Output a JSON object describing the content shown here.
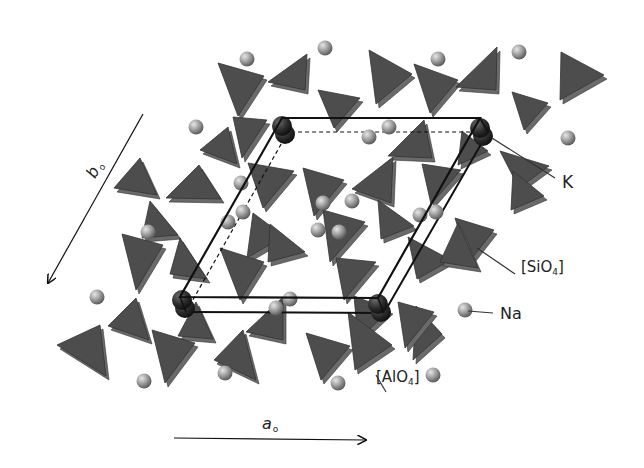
{
  "figure": {
    "title": "",
    "colors": {
      "tetrahedron": "#4d4d4d",
      "tetrahedron_edge": "#333333",
      "tetrahedron_shade": "#6a6a6a",
      "na_atom": "#9a9a9a",
      "k_atom": "#2e2e2e",
      "cell_line": "#111111",
      "leader_line": "#333333"
    },
    "axes": {
      "a": {
        "symbol": "a",
        "subscript": "o",
        "arrow": {
          "x1": 174,
          "y1": 438,
          "x2": 366,
          "y2": 440
        }
      },
      "b": {
        "symbol": "b",
        "subscript": "o",
        "arrow": {
          "x1": 143,
          "y1": 114,
          "x2": 48,
          "y2": 283
        }
      }
    },
    "labels": {
      "K": {
        "text": "K",
        "x": 562,
        "y": 172,
        "leader": {
          "x1": 492,
          "y1": 138,
          "x2": 555,
          "y2": 178
        }
      },
      "SiO4": {
        "prefix": "[SiO",
        "sub": "4",
        "suffix": "]",
        "x": 521,
        "y": 258,
        "leader": {
          "x1": 477,
          "y1": 248,
          "x2": 515,
          "y2": 274
        }
      },
      "Na": {
        "text": "Na",
        "x": 500,
        "y": 304,
        "leader": {
          "x1": 468,
          "y1": 311,
          "x2": 493,
          "y2": 313
        }
      },
      "AlO4": {
        "prefix": "[AlO",
        "sub": "4",
        "suffix": "]",
        "x": 376,
        "y": 368,
        "leader": {
          "x1": 376,
          "y1": 375,
          "x2": 386,
          "y2": 392
        }
      }
    },
    "unit_cell": {
      "front": [
        [
          282,
          118
        ],
        [
          480,
          118
        ],
        [
          378,
          298
        ],
        [
          180,
          297
        ]
      ],
      "back": [
        [
          288,
          132
        ],
        [
          488,
          132
        ],
        [
          384,
          313
        ],
        [
          186,
          312
        ]
      ]
    },
    "k_atoms": [
      [
        282,
        126
      ],
      [
        480,
        128
      ],
      [
        182,
        300
      ],
      [
        378,
        304
      ]
    ],
    "na_atoms": [
      [
        247,
        59
      ],
      [
        325,
        48
      ],
      [
        438,
        59
      ],
      [
        519,
        52
      ],
      [
        196,
        127
      ],
      [
        369,
        137
      ],
      [
        389,
        127
      ],
      [
        568,
        138
      ],
      [
        228,
        222
      ],
      [
        243,
        212
      ],
      [
        323,
        203
      ],
      [
        339,
        232
      ],
      [
        420,
        215
      ],
      [
        436,
        212
      ],
      [
        148,
        232
      ],
      [
        318,
        230
      ],
      [
        97,
        297
      ],
      [
        276,
        308
      ],
      [
        290,
        299
      ],
      [
        465,
        310
      ],
      [
        144,
        381
      ],
      [
        225,
        373
      ],
      [
        338,
        383
      ],
      [
        433,
        375
      ],
      [
        241,
        183
      ],
      [
        352,
        201
      ]
    ],
    "tetrahedra": [
      [
        [
          218,
          63
        ],
        [
          264,
          76
        ],
        [
          238,
          116
        ]
      ],
      [
        [
          307,
          54
        ],
        [
          305,
          90
        ],
        [
          268,
          82
        ]
      ],
      [
        [
          369,
          50
        ],
        [
          412,
          74
        ],
        [
          376,
          104
        ]
      ],
      [
        [
          414,
          64
        ],
        [
          458,
          80
        ],
        [
          430,
          113
        ]
      ],
      [
        [
          497,
          47
        ],
        [
          496,
          90
        ],
        [
          456,
          87
        ]
      ],
      [
        [
          561,
          52
        ],
        [
          604,
          75
        ],
        [
          560,
          100
        ]
      ],
      [
        [
          318,
          90
        ],
        [
          360,
          98
        ],
        [
          334,
          128
        ]
      ],
      [
        [
          233,
          117
        ],
        [
          267,
          120
        ],
        [
          242,
          158
        ]
      ],
      [
        [
          228,
          127
        ],
        [
          200,
          150
        ],
        [
          237,
          164
        ]
      ],
      [
        [
          512,
          92
        ],
        [
          548,
          103
        ],
        [
          524,
          130
        ]
      ],
      [
        [
          424,
          120
        ],
        [
          432,
          158
        ],
        [
          388,
          156
        ]
      ],
      [
        [
          462,
          131
        ],
        [
          488,
          151
        ],
        [
          458,
          165
        ]
      ],
      [
        [
          500,
          151
        ],
        [
          549,
          166
        ],
        [
          519,
          188
        ]
      ],
      [
        [
          140,
          158
        ],
        [
          157,
          195
        ],
        [
          114,
          188
        ]
      ],
      [
        [
          199,
          165
        ],
        [
          221,
          199
        ],
        [
          166,
          198
        ]
      ],
      [
        [
          248,
          163
        ],
        [
          294,
          171
        ],
        [
          263,
          208
        ]
      ],
      [
        [
          303,
          168
        ],
        [
          344,
          180
        ],
        [
          314,
          216
        ]
      ],
      [
        [
          393,
          157
        ],
        [
          391,
          203
        ],
        [
          352,
          189
        ]
      ],
      [
        [
          422,
          164
        ],
        [
          461,
          170
        ],
        [
          431,
          204
        ]
      ],
      [
        [
          513,
          171
        ],
        [
          544,
          196
        ],
        [
          511,
          210
        ]
      ],
      [
        [
          150,
          201
        ],
        [
          178,
          235
        ],
        [
          142,
          238
        ]
      ],
      [
        [
          253,
          213
        ],
        [
          284,
          236
        ],
        [
          247,
          258
        ]
      ],
      [
        [
          323,
          210
        ],
        [
          365,
          222
        ],
        [
          330,
          262
        ]
      ],
      [
        [
          378,
          200
        ],
        [
          414,
          226
        ],
        [
          381,
          239
        ]
      ],
      [
        [
          455,
          218
        ],
        [
          494,
          230
        ],
        [
          469,
          262
        ]
      ],
      [
        [
          122,
          234
        ],
        [
          163,
          245
        ],
        [
          136,
          290
        ]
      ],
      [
        [
          180,
          238
        ],
        [
          207,
          279
        ],
        [
          170,
          274
        ]
      ],
      [
        [
          270,
          224
        ],
        [
          305,
          252
        ],
        [
          268,
          262
        ]
      ],
      [
        [
          336,
          258
        ],
        [
          376,
          262
        ],
        [
          344,
          300
        ]
      ],
      [
        [
          408,
          237
        ],
        [
          451,
          260
        ],
        [
          417,
          279
        ]
      ],
      [
        [
          220,
          248
        ],
        [
          264,
          262
        ],
        [
          240,
          300
        ]
      ],
      [
        [
          458,
          223
        ],
        [
          478,
          268
        ],
        [
          440,
          262
        ]
      ],
      [
        [
          136,
          298
        ],
        [
          149,
          340
        ],
        [
          108,
          326
        ]
      ],
      [
        [
          196,
          302
        ],
        [
          213,
          339
        ],
        [
          178,
          336
        ]
      ],
      [
        [
          283,
          297
        ],
        [
          283,
          340
        ],
        [
          246,
          332
        ]
      ],
      [
        [
          354,
          296
        ],
        [
          390,
          310
        ],
        [
          358,
          340
        ]
      ],
      [
        [
          416,
          306
        ],
        [
          442,
          334
        ],
        [
          413,
          360
        ]
      ],
      [
        [
          100,
          325
        ],
        [
          106,
          376
        ],
        [
          57,
          345
        ]
      ],
      [
        [
          152,
          330
        ],
        [
          195,
          343
        ],
        [
          165,
          383
        ]
      ],
      [
        [
          243,
          330
        ],
        [
          256,
          380
        ],
        [
          214,
          360
        ]
      ],
      [
        [
          306,
          333
        ],
        [
          350,
          346
        ],
        [
          321,
          380
        ]
      ],
      [
        [
          348,
          312
        ],
        [
          392,
          345
        ],
        [
          355,
          370
        ]
      ],
      [
        [
          398,
          302
        ],
        [
          434,
          312
        ],
        [
          405,
          348
        ]
      ]
    ]
  }
}
